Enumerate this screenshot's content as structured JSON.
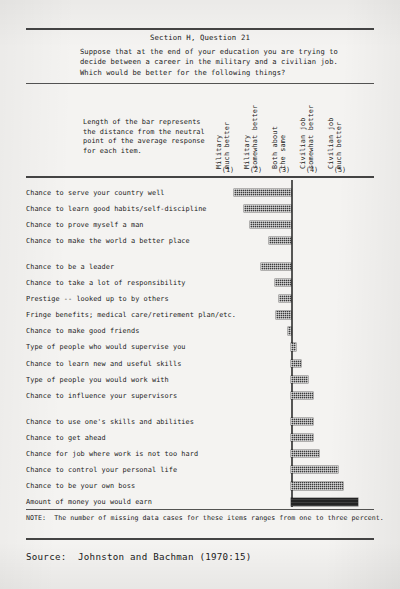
{
  "page": {
    "section_title": "Section H, Question 21",
    "question_text": "Suppose that at the end of your education you are trying to\ndecide between a career in the military and a civilian job.\nWhich would be better for the following things?",
    "legend_note": "Length of the bar represents\nthe distance from the neutral\npoint of the average response\nfor each item.",
    "footer_note": "NOTE:  The number of missing data cases for these items ranges from one to three percent.",
    "source": "Source:  Johnston and Bachman (1970:15)"
  },
  "columns": [
    {
      "label": "Military\nmuch better",
      "number": "(1)"
    },
    {
      "label": "Military\nsomewhat better",
      "number": "(2)"
    },
    {
      "label": "Both about\nthe same",
      "number": "(3)"
    },
    {
      "label": "Civilian job\nsomewhat better",
      "number": "(4)"
    },
    {
      "label": "Civilian job\nmuch better",
      "number": "(5)"
    }
  ],
  "chart_data": {
    "type": "bar",
    "title": "Section H, Question 21",
    "subtitle": "Suppose that at the end of your education you are trying to decide between a career in the military and a civilian job. Which would be better for the following things?",
    "orientation": "horizontal",
    "xlabel": "",
    "ylabel": "",
    "grid": false,
    "legend": "none",
    "neutral_point": 3,
    "scale_labels": [
      "Military much better (1)",
      "Military somewhat better (2)",
      "Both about the same (3)",
      "Civilian job somewhat better (4)",
      "Civilian job much better (5)"
    ],
    "note": "Bar length = distance from the neutral point of the average response; negative = toward military, positive = toward civilian job.",
    "groups": [
      {
        "gap_after": true,
        "items": [
          {
            "category": "Chance to serve your country well",
            "value": -1.14
          },
          {
            "category": "Chance to learn good habits/self-discipline",
            "value": -0.94
          },
          {
            "category": "Chance to prove myself a man",
            "value": -0.82
          },
          {
            "category": "Chance to make the world a better place",
            "value": -0.44
          }
        ]
      },
      {
        "gap_after": true,
        "items": [
          {
            "category": "Chance to be a leader",
            "value": -0.6
          },
          {
            "category": "Chance to take a lot of responsibility",
            "value": -0.32
          },
          {
            "category": "Prestige -- looked up to by others",
            "value": -0.24
          },
          {
            "category": "Fringe benefits; medical care/retirement plan/etc.",
            "value": -0.3
          },
          {
            "category": "Chance to make good friends",
            "value": -0.06
          },
          {
            "category": "Type of people who would supervise you",
            "value": 0.1
          },
          {
            "category": "Chance to learn new and useful skills",
            "value": 0.2
          },
          {
            "category": "Type of people you would work with",
            "value": 0.34
          },
          {
            "category": "Chance to influence your supervisors",
            "value": 0.44
          }
        ]
      },
      {
        "gap_after": false,
        "items": [
          {
            "category": "Chance to use one's skills and abilities",
            "value": 0.44
          },
          {
            "category": "Chance to get ahead",
            "value": 0.44
          },
          {
            "category": "Chance for job where work is not too hard",
            "value": 0.56
          },
          {
            "category": "Chance to control your personal life",
            "value": 0.94
          },
          {
            "category": "Chance to be your own boss",
            "value": 1.04
          },
          {
            "category": "Amount of money you would earn",
            "value": 1.34
          }
        ]
      }
    ]
  }
}
